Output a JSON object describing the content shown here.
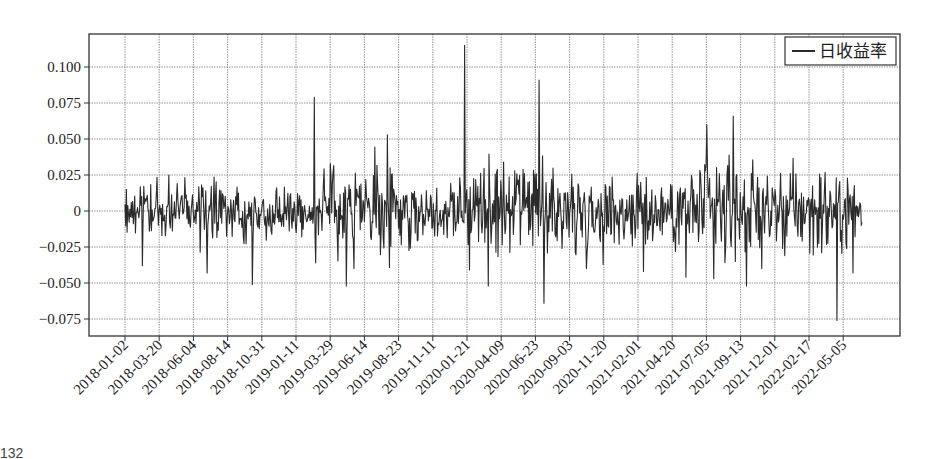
{
  "chart_data": {
    "type": "line",
    "title": "",
    "xlabel": "",
    "ylabel": "",
    "legend": {
      "entries": [
        "日收益率"
      ],
      "position": "upper right"
    },
    "grid": true,
    "ylim": [
      -0.087,
      0.118
    ],
    "yticks": [
      0.1,
      0.075,
      0.05,
      0.025,
      0,
      -0.025,
      -0.05,
      -0.075
    ],
    "ytick_labels": [
      "0.100",
      "0.075",
      "0.050",
      "0.025",
      "0",
      "−0.025",
      "−0.050",
      "−0.075"
    ],
    "xtick_labels": [
      "2018-01-02",
      "2018-03-20",
      "2018-06-04",
      "2018-08-14",
      "2018-10-31",
      "2019-01-11",
      "2019-03-29",
      "2019-06-14",
      "2019-08-23",
      "2019-11-11",
      "2020-01-21",
      "2020-04-09",
      "2020-06-23",
      "2020-09-03",
      "2020-11-20",
      "2021-02-01",
      "2021-04-20",
      "2021-07-05",
      "2021-09-13",
      "2021-12-01",
      "2022-02-17",
      "2022-05-05"
    ],
    "series": [
      {
        "name": "日收益率",
        "color": "#2b2b2b",
        "n_points": 1060,
        "notable_points": [
          {
            "date": "2018-02-09",
            "value": -0.038
          },
          {
            "date": "2018-07-03",
            "value": -0.043
          },
          {
            "date": "2018-10-11",
            "value": -0.051
          },
          {
            "date": "2019-02-25",
            "value": 0.079
          },
          {
            "date": "2019-02-28",
            "value": -0.036
          },
          {
            "date": "2019-05-06",
            "value": -0.052
          },
          {
            "date": "2019-08-05",
            "value": 0.053
          },
          {
            "date": "2020-02-03",
            "value": -0.041
          },
          {
            "date": "2020-01-23",
            "value": 0.115
          },
          {
            "date": "2020-03-16",
            "value": -0.052
          },
          {
            "date": "2020-07-06",
            "value": 0.091
          },
          {
            "date": "2020-07-16",
            "value": -0.064
          },
          {
            "date": "2021-02-22",
            "value": -0.042
          },
          {
            "date": "2021-05-27",
            "value": -0.046
          },
          {
            "date": "2021-07-12",
            "value": 0.06
          },
          {
            "date": "2021-07-27",
            "value": -0.047
          },
          {
            "date": "2021-09-08",
            "value": 0.066
          },
          {
            "date": "2021-10-08",
            "value": -0.052
          },
          {
            "date": "2022-04-25",
            "value": -0.076
          },
          {
            "date": "2022-05-31",
            "value": -0.043
          }
        ]
      }
    ]
  },
  "footer": {
    "corner_text": "132"
  }
}
